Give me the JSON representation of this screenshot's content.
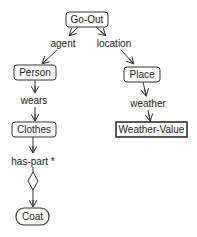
{
  "diagram": {
    "nodes": [
      {
        "id": "go-out",
        "label": "Go-Out",
        "shape": "rounded-rect"
      },
      {
        "id": "person",
        "label": "Person",
        "shape": "rounded-rect"
      },
      {
        "id": "place",
        "label": "Place",
        "shape": "rounded-rect"
      },
      {
        "id": "clothes",
        "label": "Clothes",
        "shape": "rounded-rect"
      },
      {
        "id": "weather-value",
        "label": "Weather-Value",
        "shape": "rect"
      },
      {
        "id": "coat",
        "label": "Coat",
        "shape": "pill"
      }
    ],
    "relations": [
      {
        "id": "agent",
        "label": "agent",
        "from": "go-out",
        "to": "person"
      },
      {
        "id": "location",
        "label": "location",
        "from": "go-out",
        "to": "place"
      },
      {
        "id": "wears",
        "label": "wears",
        "from": "person",
        "to": "clothes"
      },
      {
        "id": "weather",
        "label": "weather",
        "from": "place",
        "to": "weather-value"
      },
      {
        "id": "has-part",
        "label": "has-part *",
        "from": "clothes",
        "to": "coat",
        "marker": "diamond"
      }
    ],
    "colors": {
      "stroke": "#333333",
      "text": "#222222",
      "background": "#ffffff"
    }
  }
}
